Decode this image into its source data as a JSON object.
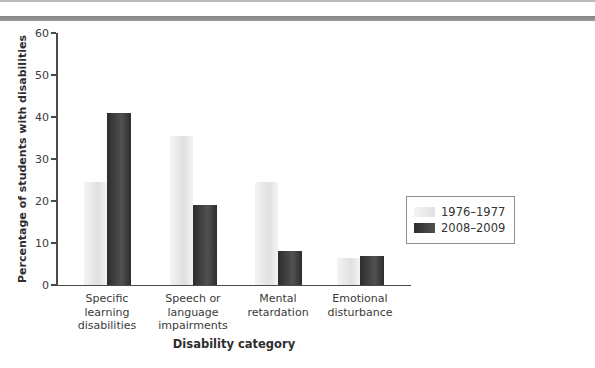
{
  "decorations": {
    "top_thin_line_color": "#bcbcbc",
    "top_divider_bar_color": "#8f8f8f"
  },
  "chart_data": {
    "type": "bar",
    "title": "",
    "xlabel": "Disability category",
    "ylabel": "Percentage of students with disabilities",
    "categories": [
      "Specific\nlearning\ndisabilities",
      "Speech or\nlanguage\nimpairments",
      "Mental\nretardation",
      "Emotional\ndisturbance"
    ],
    "series": [
      {
        "name": "1976–1977",
        "values": [
          24.5,
          35.5,
          24.5,
          6.5
        ],
        "fill_from": "#f4f4f4",
        "fill_to": "#e0e0e0"
      },
      {
        "name": "2008–2009",
        "values": [
          41,
          19,
          8,
          7
        ],
        "fill_from": "#2d2d2d",
        "fill_to": "#515151"
      }
    ],
    "ylim": [
      0,
      60
    ],
    "yticks": [
      0,
      10,
      20,
      30,
      40,
      50,
      60
    ],
    "grid": false,
    "legend_position": "right of plot, vertically centered"
  }
}
